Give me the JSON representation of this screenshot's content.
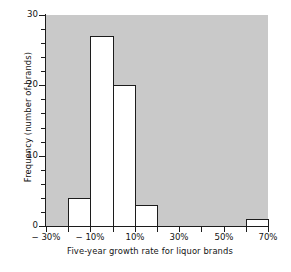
{
  "chart_data": {
    "type": "bar",
    "title": "",
    "subtitle": "",
    "xlabel": "Five-year growth rate for liquor brands",
    "ylabel": "Frequency (number of brands)",
    "xlim": [
      -30,
      70
    ],
    "ylim": [
      0,
      30
    ],
    "grid": false,
    "legend": "none",
    "bin_width": 10,
    "x_tick_labels": [
      "− 30%",
      "− 10%",
      "10%",
      "30%",
      "50%",
      "70%"
    ],
    "x_tick_values": [
      -30,
      -10,
      10,
      30,
      50,
      70
    ],
    "y_tick_labels": [
      "0",
      "10",
      "20",
      "30"
    ],
    "y_tick_values": [
      0,
      10,
      20,
      30
    ],
    "y_minor_step": 2,
    "categories": [
      "−30% to −20%",
      "−20% to −10%",
      "−10% to 0%",
      "0% to 10%",
      "10% to 20%",
      "20% to 30%",
      "30% to 40%",
      "40% to 50%",
      "50% to 60%",
      "60% to 70%"
    ],
    "bin_edges": [
      -30,
      -20,
      -10,
      0,
      10,
      20,
      30,
      40,
      50,
      60,
      70
    ],
    "values": [
      0,
      4,
      27,
      20,
      3,
      0,
      0,
      0,
      0,
      1
    ],
    "bars": [
      {
        "x0": -20,
        "x1": -10,
        "value": 4
      },
      {
        "x0": -10,
        "x1": 0,
        "value": 27
      },
      {
        "x0": 0,
        "x1": 10,
        "value": 20
      },
      {
        "x0": 10,
        "x1": 20,
        "value": 3
      },
      {
        "x0": 60,
        "x1": 70,
        "value": 1
      }
    ],
    "colors": {
      "panel_background": "#c9c9c9",
      "bar_fill": "#ffffff",
      "bar_edge": "#1c1c1c",
      "axis": "#1c1c1c",
      "text": "#141414",
      "page_background": "#ffffff"
    }
  }
}
